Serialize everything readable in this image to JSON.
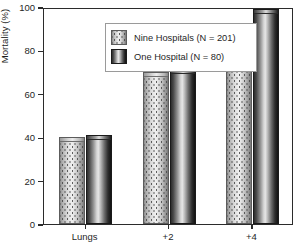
{
  "chart_data": {
    "type": "bar",
    "title": "",
    "xlabel": "",
    "ylabel": "Mortality (%)",
    "categories": [
      "Lungs",
      "+2",
      "+4"
    ],
    "ylim": [
      0,
      100
    ],
    "yticks": [
      0,
      20,
      40,
      60,
      80,
      100
    ],
    "ytick_labels": [
      "0",
      "20",
      "40",
      "60",
      "80",
      "100"
    ],
    "grid": false,
    "legend_position": "top-left-inside",
    "series": [
      {
        "name": "Nine Hospitals (N = 201)",
        "style": "light-stippled-cylinder",
        "values": [
          40,
          70,
          90
        ]
      },
      {
        "name": "One Hospital (N = 80)",
        "style": "dark-gradient-cylinder",
        "values": [
          41,
          71.5,
          99
        ]
      }
    ]
  },
  "axes": {
    "y_label": "Mortality (%)",
    "y_ticks": [
      {
        "value": 100,
        "label": "100"
      },
      {
        "value": 80,
        "label": "80"
      },
      {
        "value": 60,
        "label": "60"
      },
      {
        "value": 40,
        "label": "40"
      },
      {
        "value": 20,
        "label": "20"
      },
      {
        "value": 0,
        "label": "0"
      }
    ],
    "x_ticks": [
      {
        "label": "Lungs"
      },
      {
        "label": "+2"
      },
      {
        "label": "+4"
      }
    ]
  },
  "legend": {
    "entries": [
      {
        "label": "Nine Hospitals (N = 201)",
        "swatch": "light-stippled-swatch"
      },
      {
        "label": "One Hospital (N = 80)",
        "swatch": "dark-gradient-swatch"
      }
    ]
  },
  "colors": {
    "axis": "#2b2b2b",
    "text": "#1f1f1f",
    "background": "#ffffff",
    "legend_border": "#9a9a9a",
    "series_light": "#d0d0d0",
    "series_dark": "#2c2c2c"
  }
}
